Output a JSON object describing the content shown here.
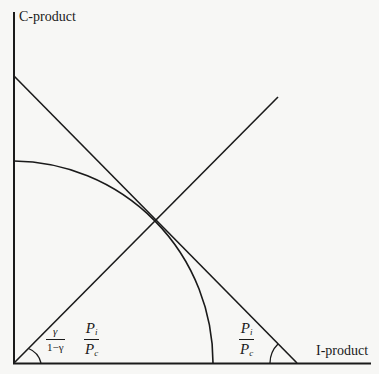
{
  "diagram": {
    "y_axis_label": "C-product",
    "x_axis_label": "I-product",
    "origin_angle_label": {
      "coef_num": "γ",
      "coef_den": "1−γ",
      "ratio_num_base": "P",
      "ratio_num_sub": "i",
      "ratio_den_base": "P",
      "ratio_den_sub": "c"
    },
    "intercept_angle_label": {
      "ratio_num_base": "P",
      "ratio_num_sub": "i",
      "ratio_den_base": "P",
      "ratio_den_sub": "c"
    },
    "elements": [
      "vertical axis (C-product)",
      "horizontal axis (I-product)",
      "quarter-circle production possibility frontier",
      "tangent price line",
      "ray from origin through tangency point",
      "angle arc at origin",
      "angle arc at price-line x-intercept"
    ],
    "colors": {
      "ink": "#1a1a1a",
      "paper": "#f7f7f5"
    }
  }
}
